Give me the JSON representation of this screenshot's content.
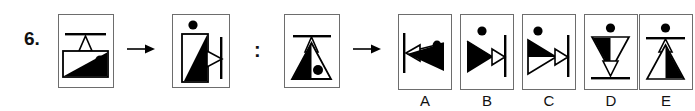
{
  "page": {
    "background_color": "#ffffff",
    "ink_color": "#000000",
    "box_border_color": "#6d6d6d",
    "width": 695,
    "height": 111
  },
  "question": {
    "number_label": "6.",
    "type": "visual-analogy",
    "relation_symbol": ":",
    "transform_arrow": "→"
  },
  "prompt": {
    "source_figure": {
      "name": "figure-1-source",
      "description": "upright rectangle panel: horizontal bar near top, small outlined triangle hanging below bar, lower rectangle filled with black diagonal wedge rising left-to-right and a black dot at upper right",
      "box": {
        "x": 58,
        "y": 14,
        "w": 56,
        "h": 74
      }
    },
    "result_figure": {
      "name": "figure-2-result",
      "description": "same panel rotated 90 degrees counter-clockwise: black dot floats at top, tall rectangle holds black wedge, outlined triangle points right, vertical bar at right edge",
      "box": {
        "x": 172,
        "y": 14,
        "w": 58,
        "h": 74
      }
    },
    "query_figure": {
      "name": "figure-3-query",
      "description": "upright panel: horizontal bar near top, small outlined triangle under bar, large filled/outlined triangle with black dot inside lower right",
      "box": {
        "x": 284,
        "y": 14,
        "w": 56,
        "h": 74
      }
    }
  },
  "answers": {
    "label_prefix": "option",
    "options": [
      {
        "letter": "A",
        "name": "option-a",
        "description": "vertical bar at left, outlined arrowhead pointing left, black wedge triangle and black dot at upper right",
        "box": {
          "x": 404,
          "y": 14,
          "w": 54,
          "h": 76
        }
      },
      {
        "letter": "B",
        "name": "option-b",
        "description": "black dot at top, black triangle pointing right, outlined arrowhead pointing right, vertical bar at right",
        "box": {
          "x": 466,
          "y": 14,
          "w": 54,
          "h": 76
        }
      },
      {
        "letter": "C",
        "name": "option-c",
        "description": "black dot at top left, black wedge over outlined triangle pointing right, outlined arrowhead, vertical bar at right",
        "box": {
          "x": 528,
          "y": 14,
          "w": 54,
          "h": 76
        }
      },
      {
        "letter": "D",
        "name": "option-d",
        "description": "black dot at top, large downward triangle half filled black, small outlined downward arrowhead, horizontal bar at bottom",
        "box": {
          "x": 590,
          "y": 14,
          "w": 54,
          "h": 76
        }
      },
      {
        "letter": "E",
        "name": "option-e",
        "description": "black dot at top, horizontal bar, small outlined upward triangle, large triangle with right half filled black",
        "box": {
          "x": 640,
          "y": 14,
          "w": 54,
          "h": 76
        }
      }
    ]
  },
  "arrows": [
    {
      "name": "arrow-source-to-result",
      "x": 126,
      "y": 44
    },
    {
      "name": "arrow-query-to-options",
      "x": 352,
      "y": 44
    }
  ]
}
